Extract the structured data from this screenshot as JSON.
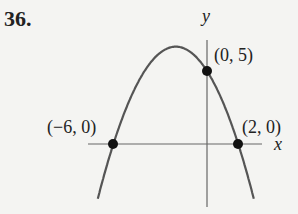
{
  "problem_number": "36.",
  "chart_data": {
    "type": "line",
    "title": "",
    "xlabel": "x",
    "ylabel": "y",
    "function": "y = -(5/12)(x+6)(x-2)",
    "grid": false,
    "legend": null,
    "series": [
      {
        "name": "parabola",
        "x": [
          -7.5,
          -6,
          -4,
          -2,
          0,
          2,
          3.5
        ],
        "y": [
          -5.63,
          0,
          5.0,
          6.67,
          5,
          0,
          -6.56
        ]
      }
    ],
    "marked_points": [
      {
        "x": -6,
        "y": 0,
        "label": "(−6, 0)"
      },
      {
        "x": 0,
        "y": 5,
        "label": "(0, 5)"
      },
      {
        "x": 2,
        "y": 0,
        "label": "(2, 0)"
      }
    ],
    "xlim": [
      -7.5,
      3.7
    ],
    "ylim": [
      -6.5,
      7.5
    ],
    "colors": {
      "curve": "#555555",
      "axes": "#666666",
      "points": "#111111"
    }
  },
  "labels": {
    "x_axis": "x",
    "y_axis": "y",
    "p1": "(−6, 0)",
    "p2": "(0, 5)",
    "p3": "(2, 0)"
  }
}
